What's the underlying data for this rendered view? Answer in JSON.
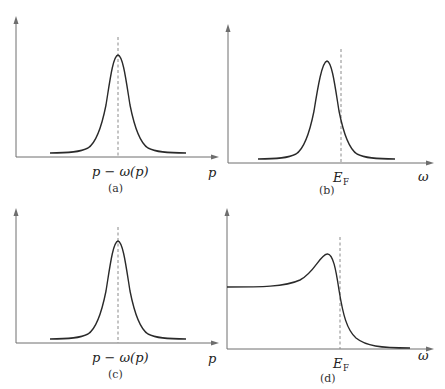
{
  "figure": {
    "panels": [
      {
        "id": "a",
        "caption": "(a)",
        "x_label": "p",
        "tick_label": "p − ω(p)",
        "curve": "symmetric-lorentzian-peak"
      },
      {
        "id": "b",
        "caption": "(b)",
        "x_label": "ω",
        "tick_label_main": "E",
        "tick_label_sub": "F",
        "curve": "peak-below-fermi-level"
      },
      {
        "id": "c",
        "caption": "(c)",
        "x_label": "p",
        "tick_label": "p − ω(p)",
        "curve": "symmetric-lorentzian-peak"
      },
      {
        "id": "d",
        "caption": "(d)",
        "x_label": "ω",
        "tick_label_main": "E",
        "tick_label_sub": "F",
        "curve": "plateau-with-peak-then-fermi-cutoff"
      }
    ]
  }
}
